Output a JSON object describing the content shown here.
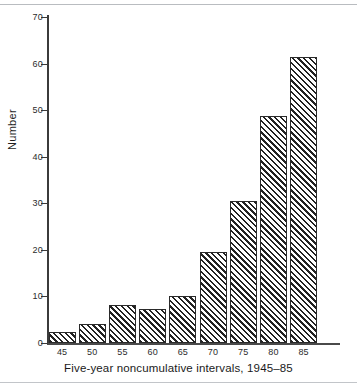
{
  "chart_data": {
    "type": "bar",
    "title": "",
    "xlabel": "Five-year noncumulative intervals, 1945–85",
    "ylabel": "Number",
    "categories": [
      "45",
      "50",
      "55",
      "60",
      "65",
      "70",
      "75",
      "80",
      "85"
    ],
    "values": [
      2.3,
      4.1,
      8.2,
      7.3,
      10.0,
      19.5,
      30.6,
      48.7,
      61.5
    ],
    "ylim": [
      0,
      70
    ],
    "yticks": [
      0,
      10,
      20,
      30,
      40,
      50,
      60,
      70
    ],
    "ytick_labels": [
      "0",
      "10",
      "20",
      "30",
      "40",
      "50",
      "60",
      "70"
    ],
    "xtick_labels": [
      "45",
      "50",
      "55",
      "60",
      "65",
      "70",
      "75",
      "80",
      "85"
    ],
    "grid": false,
    "legend": null,
    "bar_fill": "diagonal-hatch",
    "colors": {
      "bar_hatch": "#222222",
      "bar_background": "#ffffff",
      "bar_border": "#2a2a2a",
      "axis": "#3b3b3b",
      "text": "#1a1a1a"
    }
  }
}
